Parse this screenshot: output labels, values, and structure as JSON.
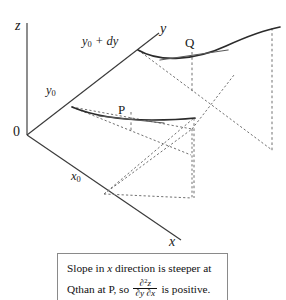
{
  "figure": {
    "type": "3d-surface-partial-derivative-diagram",
    "axes": [
      {
        "name": "z-axis",
        "label": "z",
        "direction": "vertical-up"
      },
      {
        "name": "y-axis",
        "label": "y",
        "direction": "up-right"
      },
      {
        "name": "x-axis",
        "label": "x",
        "direction": "down-right"
      }
    ],
    "origin_label": "0",
    "axis_labels": {
      "z": "z",
      "y": "y",
      "x": "x"
    },
    "value_labels": {
      "y0": "y",
      "y0_sub": "0",
      "y0_plus_dy": "y",
      "y0_plus_dy_sub": "0",
      "y0_plus_dy_rest": " + dy",
      "x0": "x",
      "x0_sub": "0"
    },
    "points": [
      {
        "name": "P",
        "label": "P",
        "description": "point on lower cross-section curve at y = y0"
      },
      {
        "name": "Q",
        "label": "Q",
        "description": "point on upper cross-section curve at y = y0 + dy"
      }
    ],
    "curves": [
      {
        "name": "upper-curve",
        "at": "y0 + dy",
        "through": "Q",
        "shape": "concave-up"
      },
      {
        "name": "lower-curve",
        "at": "y0",
        "through": "P",
        "shape": "concave-up"
      }
    ],
    "tangents": [
      {
        "name": "tangent-at-Q",
        "at_point": "Q",
        "note": "steeper"
      },
      {
        "name": "tangent-at-P",
        "at_point": "P",
        "note": "less steep"
      }
    ]
  },
  "caption": {
    "line1_a": "Slope in ",
    "line1_x": "x",
    "line1_b": " direction is steeper at Q",
    "line2_a": "than at P, so ",
    "line2_b": " is positive.",
    "fraction_numerator_a": "∂",
    "fraction_numerator_sup": "2",
    "fraction_numerator_b": "z",
    "fraction_denominator": "∂y ∂x",
    "full_text": "Slope in x direction is steeper at Q than at P, so ∂²z/∂y∂x is positive."
  },
  "colors": {
    "background": "#ffffff",
    "axis": "#3a3a3a",
    "curve": "#2b2b2b",
    "dashed": "#707070",
    "caption_border": "#8a8a8a",
    "text": "#1a1a1a"
  }
}
